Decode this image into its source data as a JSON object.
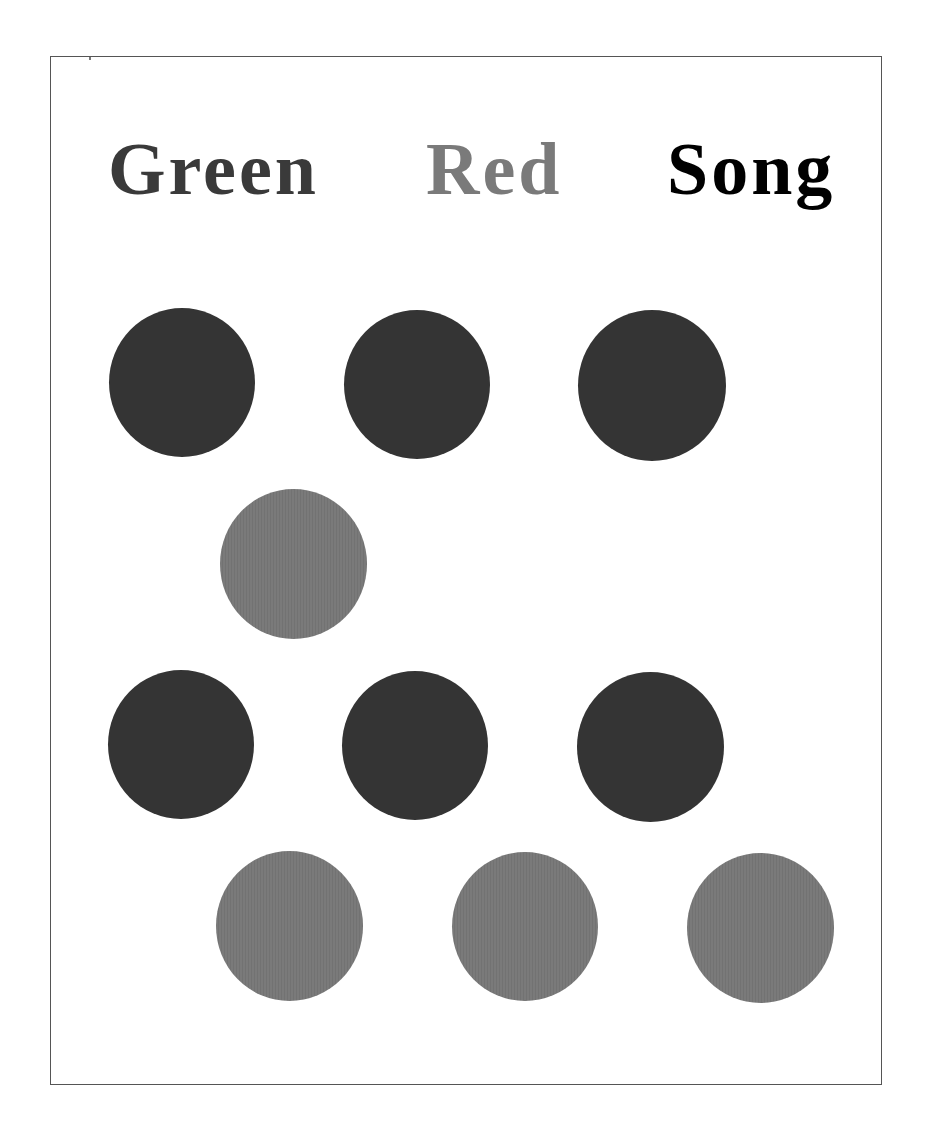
{
  "words": [
    {
      "text": "Green",
      "color": "#3a3a3a",
      "left": 108
    },
    {
      "text": "Red",
      "color": "#7a7a7a",
      "left": 426
    },
    {
      "text": "Song",
      "color": "#000000",
      "left": 667
    }
  ],
  "colors": {
    "dark_circle": "#343434",
    "light_circle": "#7a7a7a",
    "frame_border": "#555555"
  },
  "circles": [
    {
      "row": 1,
      "tone": "dark",
      "left": 109,
      "top": 308,
      "size": 146
    },
    {
      "row": 1,
      "tone": "dark",
      "left": 344,
      "top": 310,
      "size": 146
    },
    {
      "row": 1,
      "tone": "dark",
      "left": 578,
      "top": 310,
      "size": 148
    },
    {
      "row": 2,
      "tone": "light",
      "left": 220,
      "top": 489,
      "size": 147
    },
    {
      "row": 3,
      "tone": "dark",
      "left": 108,
      "top": 670,
      "size": 146
    },
    {
      "row": 3,
      "tone": "dark",
      "left": 342,
      "top": 671,
      "size": 146
    },
    {
      "row": 3,
      "tone": "dark",
      "left": 577,
      "top": 672,
      "size": 147
    },
    {
      "row": 4,
      "tone": "light",
      "left": 216,
      "top": 851,
      "size": 147
    },
    {
      "row": 4,
      "tone": "light",
      "left": 452,
      "top": 852,
      "size": 146
    },
    {
      "row": 4,
      "tone": "light",
      "left": 687,
      "top": 853,
      "size": 147
    }
  ]
}
